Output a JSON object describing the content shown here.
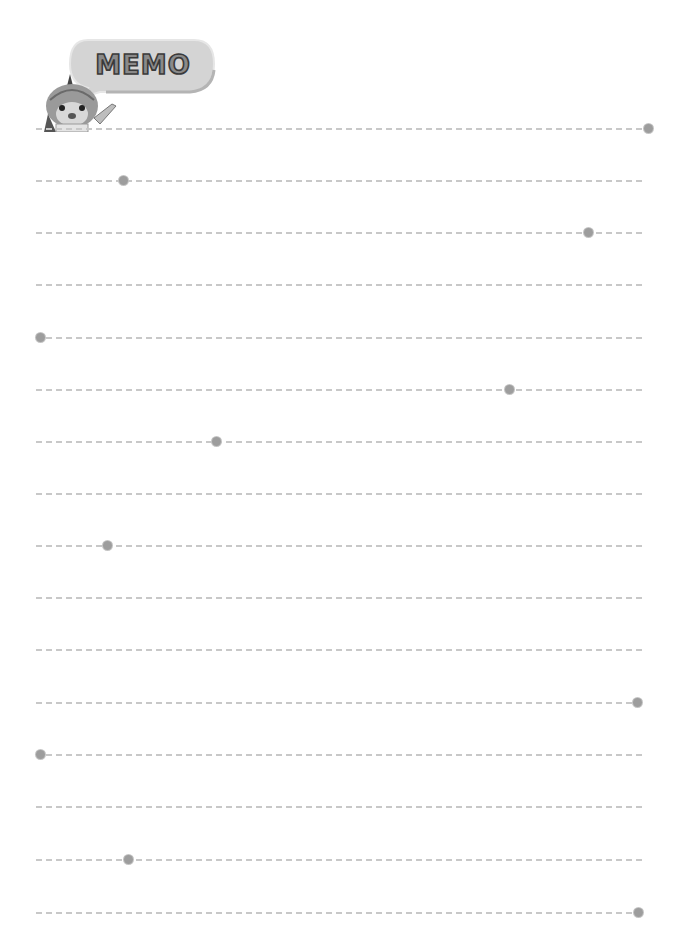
{
  "header": {
    "title": "MEMO",
    "mascot": "cartoon-creature-pointing"
  },
  "colors": {
    "line": "#c8c8c8",
    "dot": "#9d9d9d",
    "bubble": "#d4d4d4",
    "title_fill": "#8a8a8a",
    "title_stroke": "#3a3a3a"
  },
  "lines": [
    {
      "y": 128,
      "dot_x": 648
    },
    {
      "y": 180,
      "dot_x": 123
    },
    {
      "y": 232,
      "dot_x": 588
    },
    {
      "y": 284,
      "dot_x": null
    },
    {
      "y": 337,
      "dot_x": 40
    },
    {
      "y": 389,
      "dot_x": 509
    },
    {
      "y": 441,
      "dot_x": 216
    },
    {
      "y": 493,
      "dot_x": null
    },
    {
      "y": 545,
      "dot_x": 107
    },
    {
      "y": 597,
      "dot_x": null
    },
    {
      "y": 649,
      "dot_x": null
    },
    {
      "y": 702,
      "dot_x": 637
    },
    {
      "y": 754,
      "dot_x": 40
    },
    {
      "y": 806,
      "dot_x": null
    },
    {
      "y": 859,
      "dot_x": 128
    },
    {
      "y": 912,
      "dot_x": 638
    }
  ]
}
